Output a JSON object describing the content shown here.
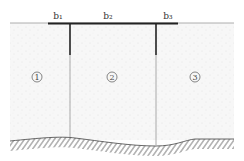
{
  "diagram": {
    "top_labels": [
      {
        "id": "b1",
        "text": "b₁",
        "x": 58
      },
      {
        "id": "b2",
        "text": "b₂",
        "x": 108
      },
      {
        "id": "b3",
        "text": "b₃",
        "x": 168
      }
    ],
    "zones": [
      {
        "id": "zone1",
        "text": "1",
        "x": 37,
        "y": 78
      },
      {
        "id": "zone2",
        "text": "2",
        "x": 112,
        "y": 78
      },
      {
        "id": "zone3",
        "text": "3",
        "x": 195,
        "y": 78
      }
    ],
    "colors": {
      "line": "#222222",
      "thin": "#888888",
      "soil": "#f3f3f3",
      "hatch": "#444444"
    }
  }
}
